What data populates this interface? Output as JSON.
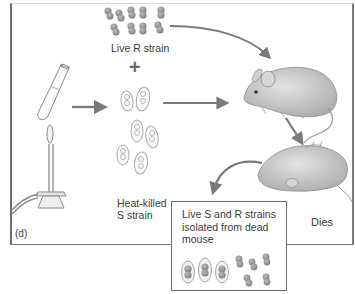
{
  "figure": {
    "panel_label": "(d)",
    "labels": {
      "live_r_strain": "Live R strain",
      "plus": "+",
      "heat_killed_line1": "Heat-killed",
      "heat_killed_line2": "S strain",
      "dies": "Dies"
    },
    "result_box": {
      "line1": "Live S and R strains",
      "line2": "isolated from dead",
      "line3": "mouse"
    },
    "elements": [
      "test-tube",
      "bunsen-burner",
      "live-r-strain-cluster",
      "heat-killed-s-strain-cells",
      "live-mouse",
      "dead-mouse",
      "live-s-and-r-bacteria"
    ],
    "colors": {
      "line": "#6e6e6e",
      "arrow": "#7a7a7a",
      "bacteria_r": "#8f8f8f",
      "capsule_outline": "#a8a8a8",
      "mouse_fill": "#c9c9c9",
      "text": "#3b3b3b"
    }
  }
}
